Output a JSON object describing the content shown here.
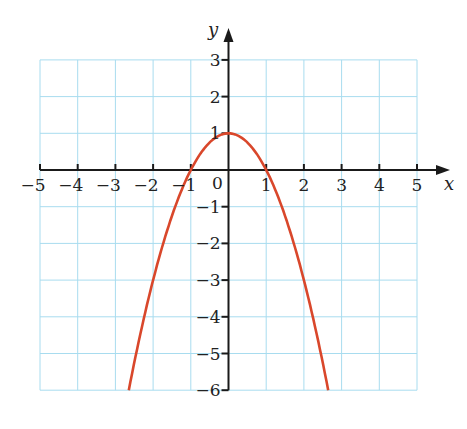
{
  "chart_data": {
    "type": "line",
    "title": "",
    "function": "y = 1 - x^2",
    "xlabel": "x",
    "ylabel": "y",
    "xlim": [
      -5,
      5
    ],
    "ylim": [
      -6,
      3
    ],
    "grid": true,
    "x_ticks": [
      -5,
      -4,
      -3,
      -2,
      -1,
      0,
      1,
      2,
      3,
      4,
      5
    ],
    "y_ticks": [
      -6,
      -5,
      -4,
      -3,
      -2,
      -1,
      1,
      2,
      3
    ],
    "x_tick_labels": [
      "−5",
      "−4",
      "−3",
      "−2",
      "−1",
      "1",
      "2",
      "3",
      "4",
      "5"
    ],
    "y_tick_labels": [
      "3",
      "2",
      "1",
      "−1",
      "−2",
      "−3",
      "−4",
      "−5",
      "−6"
    ],
    "origin_label": "0",
    "series": [
      {
        "name": "parabola",
        "color": "#d9472b",
        "x": [
          -2.646,
          -2,
          -1.5,
          -1,
          -0.5,
          0,
          0.5,
          1,
          1.5,
          2,
          2.646
        ],
        "y": [
          -6,
          -3,
          -1.25,
          0,
          0.75,
          1,
          0.75,
          0,
          -1.25,
          -3,
          -6
        ]
      }
    ],
    "colors": {
      "grid": "#a8dcef",
      "axis": "#1a1a1a",
      "curve": "#d9472b"
    }
  }
}
